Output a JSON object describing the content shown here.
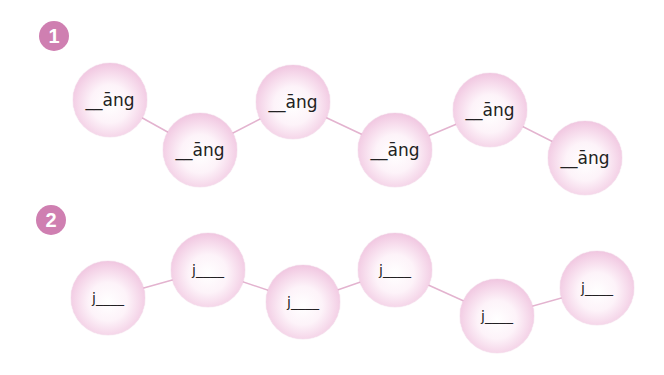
{
  "exercises": [
    {
      "number": "1",
      "items": [
        {
          "text": "__āng",
          "x": 110,
          "y": 100
        },
        {
          "text": "__āng",
          "x": 200,
          "y": 150
        },
        {
          "text": "__āng",
          "x": 293,
          "y": 102
        },
        {
          "text": "__āng",
          "x": 395,
          "y": 150
        },
        {
          "text": "__āng",
          "x": 490,
          "y": 110
        },
        {
          "text": "__āng",
          "x": 585,
          "y": 158
        }
      ]
    },
    {
      "number": "2",
      "items": [
        {
          "text": "j____",
          "x": 108,
          "y": 298
        },
        {
          "text": "j____",
          "x": 208,
          "y": 270
        },
        {
          "text": "j____",
          "x": 303,
          "y": 302
        },
        {
          "text": "j____",
          "x": 395,
          "y": 270
        },
        {
          "text": "j____",
          "x": 497,
          "y": 316
        },
        {
          "text": "j____",
          "x": 597,
          "y": 288
        }
      ]
    }
  ],
  "colors": {
    "badge": "#cf7fb1",
    "link": "#e3b3cf"
  }
}
